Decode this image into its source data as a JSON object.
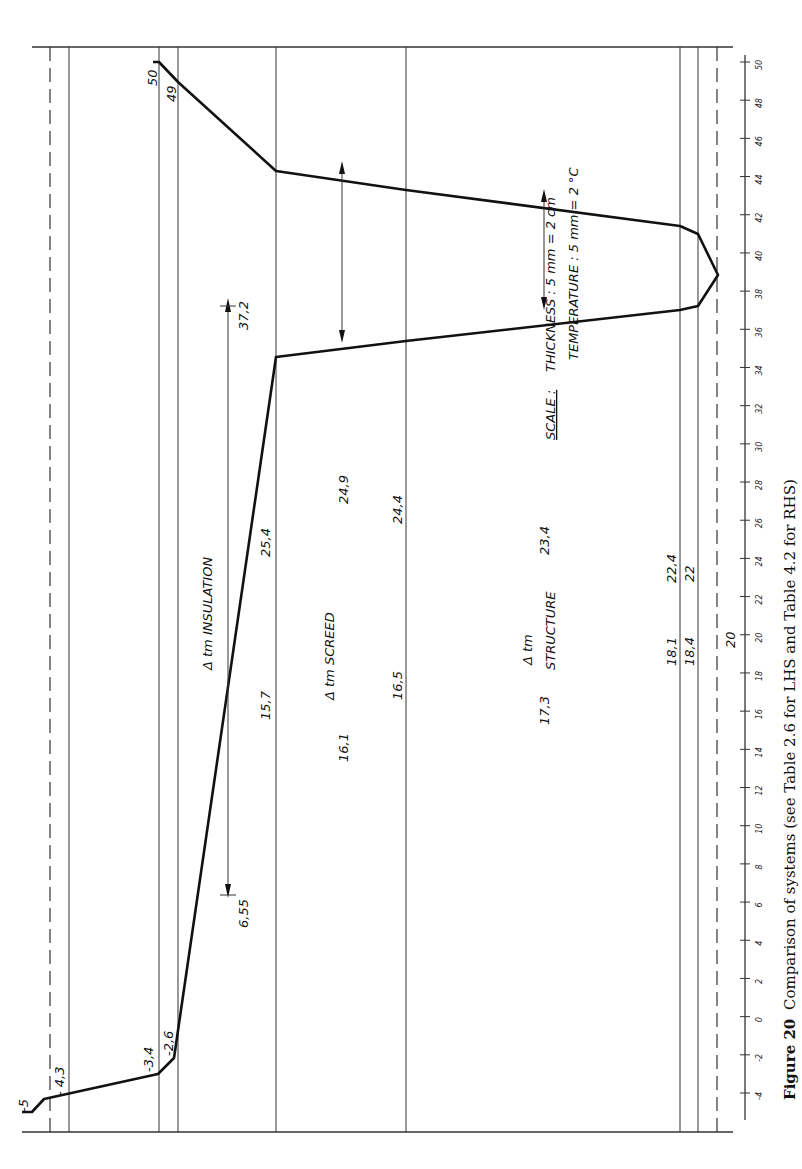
{
  "figure": {
    "caption_label": "Figure 20",
    "caption_text": "Comparison of systems (see Table 2.6 for LHS and Table 4.2 for RHS)",
    "orientation": "rotated 90° clockwise (temperature axis vertical, layer thickness horizontal)"
  },
  "scale_note": {
    "title": "SCALE :",
    "thickness": "THICKNESS :  5 mm  =  2 cm",
    "temperature": "TEMPERATURE :  5 mm  =  2 °C"
  },
  "annotations": {
    "insulation": "Δ tm   INSULATION",
    "screed": "Δ tm   SCREED",
    "structure_top": "Δ tm",
    "structure_bottom": "STRUCTURE"
  },
  "axis": {
    "ticks": [
      "50",
      "48",
      "46",
      "44",
      "42",
      "40",
      "38",
      "36",
      "34",
      "32",
      "30",
      "28",
      "26",
      "24",
      "22",
      "20",
      "18",
      "16",
      "14",
      "12",
      "10",
      "8",
      "6",
      "4",
      "2",
      "0",
      "-2",
      "-4"
    ]
  },
  "point_labels": {
    "p_minus5": "-5",
    "p_minus43": "- 4,3",
    "p_minus34": "-3,4",
    "p_minus26": "-2,6",
    "p_157": "15,7",
    "p_161": "16,1",
    "p_165": "16,5",
    "p_173": "17,3",
    "p_181": "18,1",
    "p_184": "18,4",
    "p_20": "20",
    "p_22": "22",
    "p_224": "22,4",
    "p_234": "23,4",
    "p_244": "24,4",
    "p_249": "24,9",
    "p_254": "25,4",
    "p_372": "37,2",
    "p_655": "6,55",
    "p_49": "49",
    "p_50": "50"
  },
  "chart_data": {
    "type": "line",
    "xlabel": "Position through construction (layer boundaries)",
    "ylabel": "Temperature (°C)",
    "ylim": [
      -4,
      50
    ],
    "layers": [
      "outside air film",
      "outer surface",
      "insulation",
      "screed",
      "structure",
      "inner layers",
      "inside air"
    ],
    "series": [
      {
        "name": "temperature profile",
        "boundaries": [
          "outside air",
          "surface",
          "layer 1",
          "layer 2",
          "insulation face",
          "screed/structure",
          "structure face",
          "inner face",
          "inside"
        ],
        "lower_branch": [
          -5,
          -4.3,
          -3.4,
          -2.6,
          15.7,
          16.5,
          18.1,
          18.4,
          20
        ],
        "upper_branch": [
          50,
          49,
          null,
          null,
          25.4,
          24.4,
          22.4,
          22,
          20
        ]
      }
    ],
    "mean_temperatures": {
      "insulation": [
        6.55,
        37.2
      ],
      "screed": [
        16.1,
        24.9
      ],
      "structure": [
        17.3,
        23.4
      ]
    },
    "scale": {
      "thickness": "5 mm = 2 cm",
      "temperature": "5 mm = 2 °C"
    }
  }
}
